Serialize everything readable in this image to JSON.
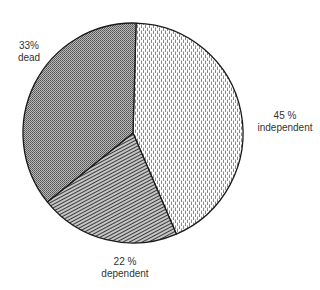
{
  "chart_data": {
    "type": "pie",
    "title": "",
    "categories": [
      "independent",
      "dependent",
      "dead"
    ],
    "values": [
      45,
      22,
      33
    ],
    "unit": "%",
    "labels": [
      {
        "value_text": "45 %",
        "name": "independent"
      },
      {
        "value_text": "22 %",
        "name": "dependent"
      },
      {
        "value_text": "33%",
        "name": "dead"
      }
    ],
    "fills": {
      "independent": "light dashed vertical hatching",
      "dependent": "dense diagonal line hatching",
      "dead": "fine dotted stipple (dark grey)"
    },
    "legend": "none (direct labels)",
    "start_angle_deg": -88.4,
    "direction": "clockwise"
  },
  "labels": {
    "independent": {
      "pct": "45 %",
      "name": "independent"
    },
    "dependent": {
      "pct": "22 %",
      "name": "dependent"
    },
    "dead": {
      "pct": "33%",
      "name": "dead"
    }
  }
}
